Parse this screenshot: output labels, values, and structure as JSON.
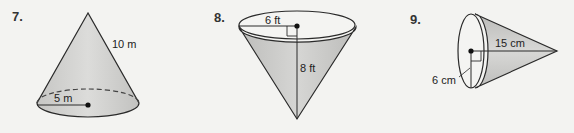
{
  "problems": [
    {
      "number": "7.",
      "figure": "cone-upright",
      "labels": {
        "slant_height": "10 m",
        "radius": "5 m"
      }
    },
    {
      "number": "8.",
      "figure": "cone-inverted",
      "labels": {
        "radius": "6 ft",
        "height": "8 ft"
      }
    },
    {
      "number": "9.",
      "figure": "cone-sideways",
      "labels": {
        "slant_height": "15 cm",
        "radius": "6 cm"
      }
    }
  ],
  "colors": {
    "background": "#f3f3f1",
    "shade": "#c9c9c7",
    "shade_light": "#d8d8d6",
    "stroke": "#2a2a2a"
  }
}
